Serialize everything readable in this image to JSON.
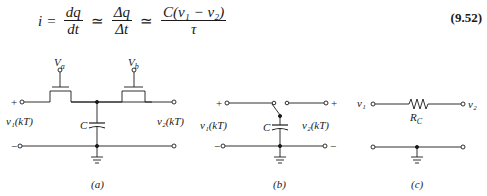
{
  "equation": {
    "lhs": "i",
    "eq": "=",
    "f1_num": "dq",
    "f1_den": "dt",
    "approx1": "≃",
    "f2_num": "Δq",
    "f2_den": "Δt",
    "approx2": "≃",
    "f3_num": "C(v₁ − v₂)",
    "f3_den": "τ",
    "number": "(9.52)"
  },
  "figure": {
    "a": {
      "caption": "(a)",
      "gate_a": "V",
      "gate_a_sub": "a",
      "gate_b": "V",
      "gate_b_sub": "b",
      "cap": "C",
      "v1": "v₁(kT)",
      "v2": "v₂(kT)",
      "plus": "+",
      "minus": "−"
    },
    "b": {
      "caption": "(b)",
      "cap": "C",
      "v1": "v₁(kT)",
      "v2": "v₂(kT)",
      "plus": "+",
      "minus": "−"
    },
    "c": {
      "caption": "(c)",
      "v1": "v₁",
      "v2": "v₂",
      "res": "R",
      "res_sub": "C"
    }
  }
}
